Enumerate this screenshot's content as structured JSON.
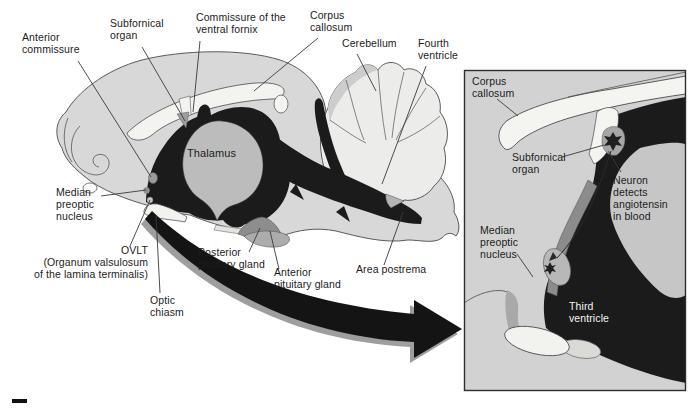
{
  "figure_type": "brain-anatomy-diagram",
  "colors": {
    "background": "#ffffff",
    "brain_gray": "#d8d8d8",
    "white_matter": "#f3f3f0",
    "ventricle_black": "#1b1b1b",
    "thalamus_gray": "#bcbcbc",
    "inset_background": "#d2d2d2",
    "label_text": "#1c1c1c"
  },
  "main_diagram": {
    "labels": {
      "anterior_commissure": "Anterior\ncommissure",
      "subfornical_organ": "Subfornical\norgan",
      "commissure_of_the_ventral_fornix": "Commissure of the\nventral fornix",
      "corpus_callosum": "Corpus\ncallosum",
      "cerebellum": "Cerebellum",
      "fourth_ventricle": "Fourth\nventricle",
      "thalamus": "Thalamus",
      "median_preoptic_nucleus": "Median\npreoptic\nnucleus",
      "ovlt": "OVLT\n(Organum valsulosum\nof the lamina terminalis)",
      "optic_chiasm": "Optic\nchiasm",
      "posterior_pituitary_gland": "Posterior\npituitary gland",
      "anterior_pituitary_gland": "Anterior\npituitary gland",
      "area_postrema": "Area postrema"
    }
  },
  "inset_diagram": {
    "labels": {
      "corpus_callosum": "Corpus\ncallosum",
      "subfornical_organ": "Subfornical\norgan",
      "neuron_detects_angiotensin": "Neuron\ndetects\nangiotensin\nin blood",
      "median_preoptic_nucleus": "Median\npreoptic\nnucleus",
      "third_ventricle": "Third\nventricle"
    }
  }
}
